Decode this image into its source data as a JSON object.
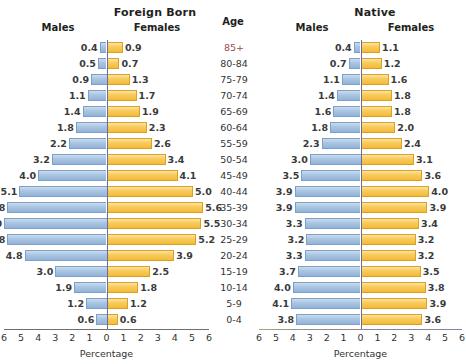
{
  "headers": {
    "foreign_title": "Foreign Born",
    "native_title": "Native",
    "age_title": "Age",
    "males": "Males",
    "females": "Females"
  },
  "axis": {
    "label": "Percentage",
    "ticks": [
      "6",
      "5",
      "4",
      "3",
      "2",
      "1",
      "0",
      "1",
      "2",
      "3",
      "4",
      "5",
      "6"
    ],
    "max": 6
  },
  "colors": {
    "male_bar": "#a9c4e2",
    "female_bar": "#f8ca5a",
    "center_line": "#6b6ba0",
    "axis_line": "#6f6f6f",
    "top_age_label": "#9a4a52"
  },
  "chart_data": {
    "type": "bar",
    "xlabel": "Percentage",
    "ylabel": "Age",
    "xlim": [
      0,
      6
    ],
    "grid": false,
    "legend": [
      "Males",
      "Females"
    ],
    "legend_position": "top",
    "categories": [
      "85+",
      "80-84",
      "75-79",
      "70-74",
      "65-69",
      "60-64",
      "55-59",
      "50-54",
      "45-49",
      "40-44",
      "35-39",
      "30-34",
      "25-29",
      "20-24",
      "15-19",
      "10-14",
      "5-9",
      "0-4"
    ],
    "panels": [
      {
        "name": "Foreign Born",
        "series": [
          {
            "name": "Males",
            "values": [
              0.4,
              0.5,
              0.9,
              1.1,
              1.4,
              1.8,
              2.2,
              3.2,
              4.0,
              5.1,
              5.8,
              6.0,
              5.8,
              4.8,
              3.0,
              1.9,
              1.2,
              0.6
            ]
          },
          {
            "name": "Females",
            "values": [
              0.9,
              0.7,
              1.3,
              1.7,
              1.9,
              2.3,
              2.6,
              3.4,
              4.1,
              5.0,
              5.6,
              5.5,
              5.2,
              3.9,
              2.5,
              1.8,
              1.2,
              0.6
            ]
          }
        ]
      },
      {
        "name": "Native",
        "series": [
          {
            "name": "Males",
            "values": [
              0.4,
              0.7,
              1.1,
              1.4,
              1.6,
              1.8,
              2.3,
              3.0,
              3.5,
              3.9,
              3.9,
              3.3,
              3.2,
              3.3,
              3.7,
              4.0,
              4.1,
              3.8
            ]
          },
          {
            "name": "Females",
            "values": [
              1.1,
              1.2,
              1.6,
              1.8,
              1.8,
              2.0,
              2.4,
              3.1,
              3.6,
              4.0,
              3.9,
              3.4,
              3.2,
              3.2,
              3.5,
              3.8,
              3.9,
              3.6
            ]
          }
        ]
      }
    ]
  }
}
